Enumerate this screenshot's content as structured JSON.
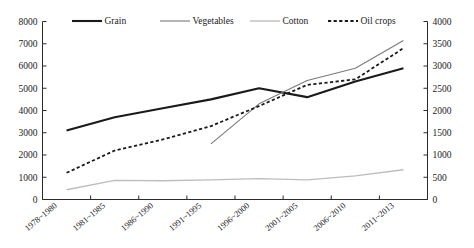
{
  "chart_data": {
    "type": "line",
    "title": "",
    "subtitle": "",
    "xlabel": "",
    "ylabel": "",
    "y2label": "",
    "categories": [
      "1978~1980",
      "1981~1985",
      "1986~1990",
      "1991~1995",
      "1996~2000",
      "2001~2005",
      "2006~2010",
      "2011~2013"
    ],
    "ylim": [
      0,
      8000
    ],
    "yticks": [
      0,
      1000,
      2000,
      3000,
      4000,
      5000,
      6000,
      7000,
      8000
    ],
    "y2lim": [
      0,
      4000
    ],
    "y2ticks": [
      0,
      500,
      1000,
      1500,
      2000,
      2500,
      3000,
      3500,
      4000
    ],
    "grid": false,
    "legend_position": "top",
    "series": [
      {
        "name": "Grain",
        "axis": "left",
        "style": "solid",
        "color": "#1a1a1a",
        "width": 2.1,
        "x": [
          "1978~1980",
          "1981~1985",
          "1986~1990",
          "1991~1995",
          "1996~2000",
          "2001~2005",
          "2006~2010",
          "2011~2013"
        ],
        "values": [
          3100,
          3700,
          4100,
          4500,
          5000,
          4600,
          5300,
          5900
        ]
      },
      {
        "name": "Vegetables",
        "axis": "left",
        "style": "solid",
        "color": "#7a7a7a",
        "width": 1.1,
        "x": [
          "1991~1995",
          "1996~2000",
          "2001~2005",
          "2006~2010",
          "2011~2013"
        ],
        "values": [
          2500,
          4300,
          5350,
          5900,
          7150
        ]
      },
      {
        "name": "Cotton",
        "axis": "right",
        "style": "solid",
        "color": "#bdbdbd",
        "width": 1.4,
        "x": [
          "1978~1980",
          "1981~1985",
          "1986~1990",
          "1991~1995",
          "1996~2000",
          "2001~2005",
          "2006~2010",
          "2011~2013"
        ],
        "values": [
          220,
          430,
          420,
          440,
          470,
          440,
          530,
          670
        ]
      },
      {
        "name": "Oil crops",
        "axis": "left",
        "style": "dashed",
        "color": "#1a1a1a",
        "width": 1.8,
        "x": [
          "1978~1980",
          "1981~1985",
          "1986~1990",
          "1991~1995",
          "1996~2000",
          "2001~2005",
          "2006~2010",
          "2011~2013"
        ],
        "values": [
          1200,
          2200,
          2700,
          3300,
          4200,
          5150,
          5400,
          6800
        ]
      }
    ],
    "legend": [
      {
        "label": "Grain",
        "style": "solid",
        "color": "#1a1a1a",
        "width": 2.1
      },
      {
        "label": "Vegetables",
        "style": "solid",
        "color": "#7a7a7a",
        "width": 1.1
      },
      {
        "label": "Cotton",
        "style": "solid",
        "color": "#bdbdbd",
        "width": 1.4
      },
      {
        "label": "Oil crops",
        "style": "dashed",
        "color": "#1a1a1a",
        "width": 1.8
      }
    ]
  }
}
